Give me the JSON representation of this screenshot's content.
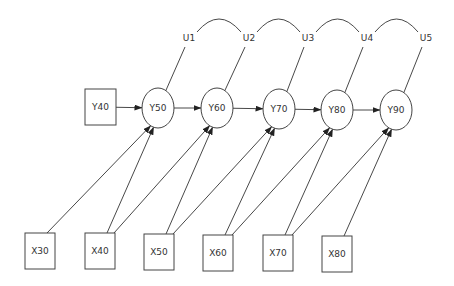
{
  "diagram": {
    "type": "path-diagram",
    "colors": {
      "line": "#333333",
      "text": "#333333",
      "background": "#ffffff"
    },
    "nodes": {
      "Y40": {
        "label": "Y40",
        "shape": "box",
        "x": 85,
        "y": 89,
        "w": 31,
        "h": 36
      },
      "Y50": {
        "label": "Y50",
        "shape": "ellipse",
        "cx": 158,
        "cy": 108,
        "rx": 16,
        "ry": 20
      },
      "Y60": {
        "label": "Y60",
        "shape": "ellipse",
        "cx": 217,
        "cy": 108,
        "rx": 16,
        "ry": 20
      },
      "Y70": {
        "label": "Y70",
        "shape": "ellipse",
        "cx": 279,
        "cy": 109,
        "rx": 16,
        "ry": 20
      },
      "Y80": {
        "label": "Y80",
        "shape": "ellipse",
        "cx": 337,
        "cy": 110,
        "rx": 16,
        "ry": 20
      },
      "Y90": {
        "label": "Y90",
        "shape": "ellipse",
        "cx": 396,
        "cy": 110,
        "rx": 16,
        "ry": 20
      },
      "X30": {
        "label": "X30",
        "shape": "box",
        "x": 25,
        "y": 233,
        "w": 30,
        "h": 36
      },
      "X40": {
        "label": "X40",
        "shape": "box",
        "x": 85,
        "y": 233,
        "w": 30,
        "h": 36
      },
      "X50": {
        "label": "X50",
        "shape": "box",
        "x": 144,
        "y": 234,
        "w": 30,
        "h": 36
      },
      "X60": {
        "label": "X60",
        "shape": "box",
        "x": 203,
        "y": 235,
        "w": 30,
        "h": 36
      },
      "X70": {
        "label": "X70",
        "shape": "box",
        "x": 263,
        "y": 235,
        "w": 30,
        "h": 36
      },
      "X80": {
        "label": "X80",
        "shape": "box",
        "x": 322,
        "y": 236,
        "w": 30,
        "h": 36
      }
    },
    "errors": [
      {
        "label": "U1",
        "x": 189,
        "y": 41,
        "target": "Y50"
      },
      {
        "label": "U2",
        "x": 249,
        "y": 41,
        "target": "Y60"
      },
      {
        "label": "U3",
        "x": 308,
        "y": 41,
        "target": "Y70"
      },
      {
        "label": "U4",
        "x": 367,
        "y": 41,
        "target": "Y80"
      },
      {
        "label": "U5",
        "x": 426,
        "y": 41,
        "target": "Y90"
      }
    ],
    "covariances": [
      [
        "U1",
        "U2"
      ],
      [
        "U2",
        "U3"
      ],
      [
        "U3",
        "U4"
      ],
      [
        "U4",
        "U5"
      ]
    ],
    "paths": [
      [
        "Y40",
        "Y50"
      ],
      [
        "Y50",
        "Y60"
      ],
      [
        "Y60",
        "Y70"
      ],
      [
        "Y70",
        "Y80"
      ],
      [
        "Y80",
        "Y90"
      ],
      [
        "X30",
        "Y50"
      ],
      [
        "X40",
        "Y50"
      ],
      [
        "X40",
        "Y60"
      ],
      [
        "X50",
        "Y60"
      ],
      [
        "X50",
        "Y70"
      ],
      [
        "X60",
        "Y70"
      ],
      [
        "X60",
        "Y80"
      ],
      [
        "X70",
        "Y80"
      ],
      [
        "X70",
        "Y90"
      ],
      [
        "X80",
        "Y90"
      ]
    ]
  }
}
